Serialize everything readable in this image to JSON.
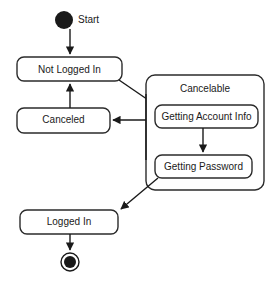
{
  "diagram": {
    "type": "uml-state-machine",
    "colors": {
      "background": "#ffffff",
      "stroke": "#2b2b2b",
      "text": "#1a1a1a",
      "fill": "#ffffff"
    },
    "initial_state": {
      "label": "Start",
      "icon": "filled-circle-icon"
    },
    "final_state": {
      "label": "",
      "icon": "bullseye-final-state-icon"
    },
    "states": [
      {
        "id": "not-logged-in",
        "label": "Not Logged In"
      },
      {
        "id": "canceled",
        "label": "Canceled"
      },
      {
        "id": "logged-in",
        "label": "Logged In"
      }
    ],
    "composite_state": {
      "id": "cancelable",
      "label": "Cancelable",
      "substates": [
        {
          "id": "getting-account-info",
          "label": "Getting Account Info"
        },
        {
          "id": "getting-password",
          "label": "Getting Password"
        }
      ]
    },
    "transitions": [
      {
        "id": "start-to-not-logged-in",
        "from": "Start",
        "to": "Not Logged In",
        "label": ""
      },
      {
        "id": "not-logged-in-to-cancelable",
        "from": "Not Logged In",
        "to": "Cancelable",
        "label": ""
      },
      {
        "id": "cancelable-to-canceled",
        "from": "Cancelable",
        "to": "Canceled",
        "label": ""
      },
      {
        "id": "canceled-to-not-logged-in",
        "from": "Canceled",
        "to": "Not Logged In",
        "label": ""
      },
      {
        "id": "account-info-to-password",
        "from": "Getting Account Info",
        "to": "Getting Password",
        "label": ""
      },
      {
        "id": "cancelable-to-logged-in",
        "from": "Cancelable",
        "to": "Logged In",
        "label": ""
      },
      {
        "id": "logged-in-to-final",
        "from": "Logged In",
        "to": "Final",
        "label": ""
      }
    ]
  }
}
